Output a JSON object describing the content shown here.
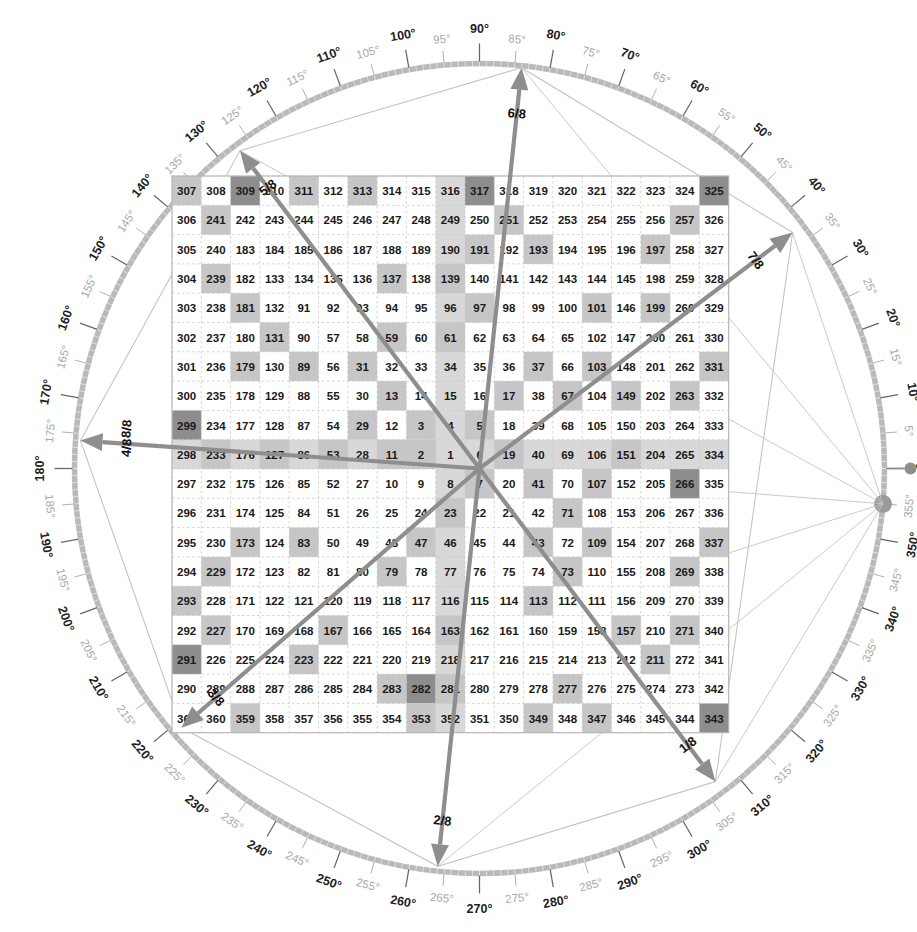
{
  "figure": {
    "type": "ulam-spiral-compass",
    "grid_size": 19,
    "center_value": 1,
    "min_value": 1,
    "max_value": 361,
    "top_left_value": 307,
    "top_right_value": 325,
    "bottom_left_value": 361,
    "bottom_right_value": 343,
    "highlight_rule": "prime numbers shaded",
    "cell_px": 29.3,
    "grid_left": 172,
    "grid_top": 176,
    "center_x": 479.5,
    "center_y": 468.5
  },
  "colors": {
    "prime_fill": "#c6c6c6",
    "band_fill": "#d8d8d8",
    "composite_fill": "#ffffff",
    "endpoint_fill": "#8d8d8d",
    "grid_line": "#c9c9c9",
    "ring": "#b9b9b9",
    "ray": "#8e8e8e",
    "polygon": "#c4c4c4",
    "deg_major": "#222222",
    "deg_minor": "#a8a8a8",
    "text": "#1a1a1a"
  },
  "compass": {
    "radius": 405,
    "tick_step_deg": 5,
    "major_step_deg": 10,
    "degree_suffix": "°",
    "major_labels": [
      "0°",
      "10°",
      "20°",
      "30°",
      "40°",
      "50°",
      "60°",
      "70°",
      "80°",
      "90°",
      "100°",
      "110°",
      "120°",
      "130°",
      "140°",
      "150°",
      "160°",
      "170°",
      "180°",
      "190°",
      "200°",
      "210°",
      "220°",
      "230°",
      "240°",
      "250°",
      "260°",
      "270°",
      "280°",
      "290°",
      "300°",
      "310°",
      "320°",
      "330°",
      "340°",
      "350°"
    ],
    "minor_labels": [
      "5°",
      "15°",
      "25°",
      "35°",
      "45°",
      "55°",
      "65°",
      "75°",
      "85°",
      "95°",
      "105°",
      "115°",
      "125°",
      "135°",
      "145°",
      "155°",
      "165°",
      "175°",
      "185°",
      "195°",
      "205°",
      "215°",
      "225°",
      "235°",
      "245°",
      "255°",
      "265°",
      "275°",
      "285°",
      "295°",
      "305°",
      "315°",
      "325°",
      "335°",
      "345°",
      "355°"
    ],
    "origin_marker_deg": 0,
    "node_marker_deg": 355
  },
  "rays": [
    {
      "label": "1/8",
      "angle_deg": 307,
      "tip_r": 392,
      "endpoint_cell": 343
    },
    {
      "label": "2/8",
      "angle_deg": 264,
      "tip_r": 400,
      "endpoint_cell": 282
    },
    {
      "label": "3/8",
      "angle_deg": 221,
      "tip_r": 395,
      "endpoint_cell": 291
    },
    {
      "label": "4/8",
      "angle_deg": 176,
      "tip_r": 400,
      "endpoint_cell": 299
    },
    {
      "label": "5/8",
      "angle_deg": 127,
      "tip_r": 398,
      "endpoint_cell": 309
    },
    {
      "label": "6/8",
      "angle_deg": 84,
      "tip_r": 403,
      "endpoint_cell": 317
    },
    {
      "label": "7/8",
      "angle_deg": 37,
      "tip_r": 392,
      "endpoint_cell": 325
    },
    {
      "label": "8/8",
      "angle_deg": 176,
      "tip_r": 400,
      "endpoint_cell": 299
    }
  ],
  "ray_label_extra": {
    "stacked_left_top": "8/8",
    "stacked_left_bottom": "4/8"
  },
  "chart_data": {
    "type": "heatmap",
    "title": "",
    "xlabel": "",
    "ylabel": "",
    "grid_rows": 19,
    "grid_cols": 19,
    "values": [
      [
        307,
        308,
        309,
        310,
        311,
        312,
        313,
        314,
        315,
        316,
        317,
        318,
        319,
        320,
        321,
        322,
        323,
        324,
        325
      ],
      [
        306,
        241,
        242,
        243,
        244,
        245,
        246,
        247,
        248,
        249,
        250,
        251,
        252,
        253,
        254,
        255,
        256,
        257,
        326
      ],
      [
        305,
        240,
        183,
        184,
        185,
        186,
        187,
        188,
        189,
        190,
        191,
        192,
        193,
        194,
        195,
        196,
        197,
        258,
        327
      ],
      [
        304,
        239,
        182,
        133,
        134,
        135,
        136,
        137,
        138,
        139,
        140,
        141,
        142,
        143,
        144,
        145,
        198,
        259,
        328
      ],
      [
        303,
        238,
        181,
        132,
        91,
        92,
        93,
        94,
        95,
        96,
        97,
        98,
        99,
        100,
        101,
        146,
        199,
        260,
        329
      ],
      [
        302,
        237,
        180,
        131,
        90,
        57,
        58,
        59,
        60,
        61,
        62,
        63,
        64,
        65,
        102,
        147,
        200,
        261,
        330
      ],
      [
        301,
        236,
        179,
        130,
        89,
        56,
        31,
        32,
        33,
        34,
        35,
        36,
        37,
        66,
        103,
        148,
        201,
        262,
        331
      ],
      [
        300,
        235,
        178,
        129,
        88,
        55,
        30,
        13,
        14,
        15,
        16,
        17,
        38,
        67,
        104,
        149,
        202,
        263,
        332
      ],
      [
        299,
        234,
        177,
        128,
        87,
        54,
        29,
        12,
        3,
        4,
        5,
        18,
        39,
        68,
        105,
        150,
        203,
        264,
        333
      ],
      [
        298,
        233,
        176,
        127,
        86,
        53,
        28,
        11,
        2,
        1,
        6,
        19,
        40,
        69,
        106,
        151,
        204,
        265,
        334
      ],
      [
        297,
        232,
        175,
        126,
        85,
        52,
        27,
        10,
        9,
        8,
        7,
        20,
        41,
        70,
        107,
        152,
        205,
        266,
        335
      ],
      [
        296,
        231,
        174,
        125,
        84,
        51,
        26,
        25,
        24,
        23,
        22,
        21,
        42,
        71,
        108,
        153,
        206,
        267,
        336
      ],
      [
        295,
        230,
        173,
        124,
        83,
        50,
        49,
        48,
        47,
        46,
        45,
        44,
        43,
        72,
        109,
        154,
        207,
        268,
        337
      ],
      [
        294,
        229,
        172,
        123,
        82,
        81,
        80,
        79,
        78,
        77,
        76,
        75,
        74,
        73,
        110,
        155,
        208,
        269,
        338
      ],
      [
        293,
        228,
        171,
        122,
        121,
        120,
        119,
        118,
        117,
        116,
        115,
        114,
        113,
        112,
        111,
        156,
        209,
        270,
        339
      ],
      [
        292,
        227,
        170,
        169,
        168,
        167,
        166,
        165,
        164,
        163,
        162,
        161,
        160,
        159,
        158,
        157,
        210,
        271,
        340
      ],
      [
        291,
        226,
        225,
        224,
        223,
        222,
        221,
        220,
        219,
        218,
        217,
        216,
        215,
        214,
        213,
        212,
        211,
        272,
        341
      ],
      [
        290,
        289,
        288,
        287,
        286,
        285,
        284,
        283,
        282,
        281,
        280,
        279,
        278,
        277,
        276,
        275,
        274,
        273,
        342
      ],
      [
        361,
        360,
        359,
        358,
        357,
        356,
        355,
        354,
        353,
        352,
        351,
        350,
        349,
        348,
        347,
        346,
        345,
        344,
        343
      ]
    ],
    "band_rows": [
      9
    ],
    "band_cols": [
      9
    ],
    "endpoint_cells": [
      343,
      282,
      291,
      299,
      309,
      317,
      325,
      266
    ],
    "legend": []
  }
}
